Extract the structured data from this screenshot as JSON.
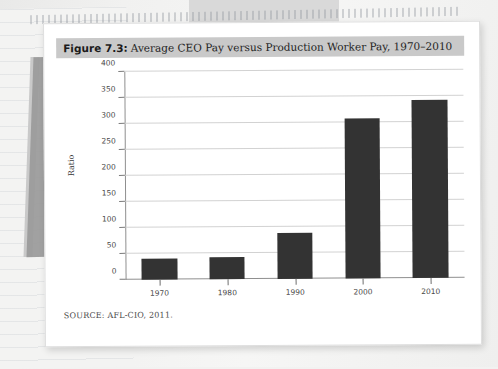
{
  "figure": {
    "caption_number": "Figure 7.3:",
    "caption_title": "Average CEO Pay versus Production Worker Pay, 1970–2010",
    "source_note": "SOURCE: AFL-CIO, 2011.",
    "caption_background_color": "#c9c9c9",
    "card_background_color": "#ffffff"
  },
  "chart_data": {
    "type": "bar",
    "title": "Average CEO Pay versus Production Worker Pay, 1970–2010",
    "subtitle": "",
    "xlabel": "",
    "ylabel": "Ratio",
    "categories": [
      "1970",
      "1980",
      "1990",
      "2000",
      "2010"
    ],
    "values": [
      41,
      42,
      88,
      308,
      343
    ],
    "series": [
      {
        "name": "Ratio of average CEO pay to production worker pay",
        "values": [
          41,
          42,
          88,
          308,
          343
        ]
      }
    ],
    "ylim": [
      0,
      400
    ],
    "yticks": [
      0,
      50,
      100,
      150,
      200,
      250,
      300,
      350,
      400
    ],
    "ytick_labels": [
      "0",
      "50",
      "100",
      "150",
      "200",
      "250",
      "300",
      "350",
      "400"
    ],
    "grid": true,
    "grid_axis": "y",
    "legend": false,
    "legend_position": "none",
    "bar_color": "#333333",
    "gridline_color": "#d2d2d2",
    "axis_color": "#8f8f8f",
    "annotations": []
  }
}
